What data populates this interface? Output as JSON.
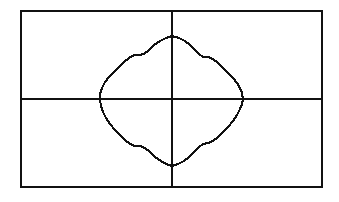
{
  "figure": {
    "title": "",
    "background_color": "#ffffff",
    "ink_color": "#111111",
    "frame": {
      "x": 21,
      "y": 11,
      "width": 301,
      "height": 176,
      "stroke_width": 2
    },
    "axes": {
      "origin_x": 172,
      "origin_y": 99,
      "horizontal_axis": {
        "x1": 21,
        "y1": 99,
        "x2": 322,
        "y2": 99
      },
      "vertical_axis": {
        "x1": 172,
        "y1": 11,
        "x2": 172,
        "y2": 187
      }
    }
  },
  "chart_data": {
    "type": "line",
    "subtype": "polar-rose",
    "title": "",
    "subtitle": "",
    "xlabel": "",
    "ylabel": "",
    "grid": false,
    "legend": null,
    "annotations": [],
    "coordinate_system": "polar",
    "equation": "r = a + b*cos(4*theta)",
    "parameters": {
      "a": 57,
      "b": 14,
      "petals": 4
    },
    "center_px": {
      "x": 172,
      "y": 101
    },
    "extent_px": {
      "left": 100,
      "right": 243,
      "top": 36,
      "bottom": 166
    },
    "xlim": [
      -1.0,
      1.0
    ],
    "ylim": [
      -1.0,
      1.0
    ],
    "xticks": [],
    "yticks": [],
    "theta_degrees": [
      0,
      10,
      20,
      30,
      40,
      50,
      60,
      70,
      80,
      90,
      100,
      110,
      120,
      130,
      140,
      150,
      160,
      170,
      180,
      190,
      200,
      210,
      220,
      230,
      240,
      250,
      260,
      270,
      280,
      290,
      300,
      310,
      320,
      330,
      340,
      350
    ],
    "r_values": [
      71,
      68,
      61,
      53,
      48,
      47,
      50,
      57,
      64,
      70,
      69,
      62,
      54,
      48,
      46,
      50,
      57,
      65,
      70,
      68,
      61,
      53,
      48,
      47,
      50,
      57,
      64,
      70,
      69,
      62,
      54,
      48,
      46,
      50,
      57,
      65
    ],
    "series": [
      {
        "name": "rose-curve",
        "color": "#111111",
        "line_width": 2,
        "closed": true,
        "points_px": [
          [
            243,
            99
          ],
          [
            242,
            93
          ],
          [
            240,
            88
          ],
          [
            237,
            83
          ],
          [
            233,
            78
          ],
          [
            228,
            73
          ],
          [
            223,
            68
          ],
          [
            218,
            63
          ],
          [
            213,
            59
          ],
          [
            208,
            57
          ],
          [
            203,
            57
          ],
          [
            199,
            54
          ],
          [
            195,
            50
          ],
          [
            190,
            45
          ],
          [
            185,
            41
          ],
          [
            179,
            38
          ],
          [
            172,
            36
          ],
          [
            166,
            38
          ],
          [
            160,
            41
          ],
          [
            154,
            45
          ],
          [
            149,
            50
          ],
          [
            144,
            54
          ],
          [
            139,
            55
          ],
          [
            134,
            55
          ],
          [
            129,
            58
          ],
          [
            124,
            62
          ],
          [
            119,
            67
          ],
          [
            114,
            72
          ],
          [
            109,
            77
          ],
          [
            105,
            82
          ],
          [
            102,
            88
          ],
          [
            100,
            94
          ],
          [
            100,
            100
          ],
          [
            101,
            106
          ],
          [
            103,
            112
          ],
          [
            106,
            118
          ],
          [
            110,
            124
          ],
          [
            115,
            130
          ],
          [
            120,
            135
          ],
          [
            125,
            140
          ],
          [
            130,
            144
          ],
          [
            135,
            146
          ],
          [
            140,
            146
          ],
          [
            145,
            148
          ],
          [
            150,
            152
          ],
          [
            155,
            157
          ],
          [
            161,
            161
          ],
          [
            166,
            164
          ],
          [
            172,
            166
          ],
          [
            178,
            164
          ],
          [
            184,
            161
          ],
          [
            189,
            157
          ],
          [
            194,
            152
          ],
          [
            199,
            147
          ],
          [
            203,
            144
          ],
          [
            208,
            143
          ],
          [
            213,
            141
          ],
          [
            218,
            137
          ],
          [
            223,
            132
          ],
          [
            228,
            127
          ],
          [
            233,
            121
          ],
          [
            237,
            115
          ],
          [
            240,
            109
          ],
          [
            242,
            104
          ],
          [
            243,
            99
          ]
        ]
      }
    ]
  },
  "elements": {
    "frame_name": "plot-frame",
    "x_axis_name": "x-axis",
    "y_axis_name": "y-axis",
    "curve_name": "polar-rose-curve"
  }
}
